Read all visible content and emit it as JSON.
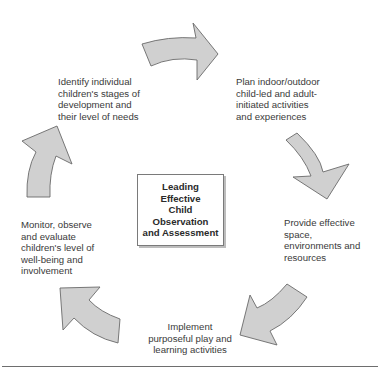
{
  "diagram": {
    "type": "cycle",
    "center": {
      "title": "Leading\nEffective\nChild\nObservation\nand Assessment"
    },
    "steps": [
      {
        "id": "identify",
        "text": "Identify individual\nchildren's stages of\ndevelopment and\ntheir level of needs"
      },
      {
        "id": "plan",
        "text": "Plan indoor/outdoor\nchild-led and adult-\ninitiated activities\nand experiences"
      },
      {
        "id": "provide",
        "text": "Provide effective\nspace,\nenvironments and\nresources"
      },
      {
        "id": "implement",
        "text": "Implement\npurposeful play and\nlearning activities"
      },
      {
        "id": "monitor",
        "text": "Monitor, observe\nand evaluate\nchildren's level of\nwell-being and\ninvolvement"
      }
    ],
    "arrows": [
      {
        "from": "identify",
        "to": "plan",
        "direction": "right"
      },
      {
        "from": "plan",
        "to": "provide",
        "direction": "down"
      },
      {
        "from": "provide",
        "to": "implement",
        "direction": "down-left"
      },
      {
        "from": "implement",
        "to": "monitor",
        "direction": "up-left"
      },
      {
        "from": "monitor",
        "to": "identify",
        "direction": "up"
      }
    ],
    "colors": {
      "arrow_fill": "#d0d0d0",
      "arrow_stroke": "#6a6a6a",
      "text": "#3a3a3a",
      "box_border": "#7a7a7a"
    }
  }
}
